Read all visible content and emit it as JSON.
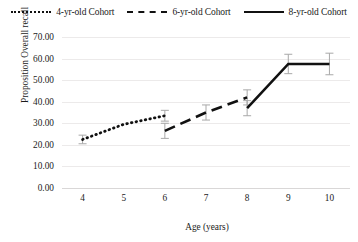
{
  "chart_data": {
    "type": "line",
    "title": "",
    "xlabel": "Age (years)",
    "ylabel": "Proposition Overall recall",
    "xlim": [
      3.5,
      10.5
    ],
    "ylim": [
      0,
      70
    ],
    "grid": true,
    "legend_position": "top",
    "x_tick_labels": [
      "4",
      "5",
      "6",
      "7",
      "8",
      "9",
      "10"
    ],
    "y_tick_labels": [
      "0.00",
      "10.00",
      "20.00",
      "30.00",
      "40.00",
      "50.00",
      "60.00",
      "70.00"
    ],
    "y_tick_values": [
      0,
      10,
      20,
      30,
      40,
      50,
      60,
      70
    ],
    "series": [
      {
        "name": "4-yr-old Cohort",
        "style": "dotted",
        "color": "#111111",
        "x": [
          4,
          5,
          6
        ],
        "values": [
          22.5,
          29.5,
          33.5
        ],
        "error": [
          2.0,
          0.0,
          2.5
        ]
      },
      {
        "name": "6-yr-old Cohort",
        "style": "dashed",
        "color": "#111111",
        "x": [
          6,
          7,
          8
        ],
        "values": [
          26.5,
          35.0,
          42.0
        ],
        "error": [
          3.5,
          3.5,
          3.5
        ]
      },
      {
        "name": "8-yr-old Cohort",
        "style": "solid",
        "color": "#111111",
        "x": [
          8,
          9,
          10
        ],
        "values": [
          37.0,
          57.5,
          57.5
        ],
        "error": [
          3.5,
          4.5,
          5.0
        ]
      }
    ]
  },
  "legend": {
    "items": [
      {
        "label": "4-yr-old Cohort",
        "swatch": "dotted-line-icon"
      },
      {
        "label": "6-yr-old Cohort",
        "swatch": "dashed-line-icon"
      },
      {
        "label": "8-yr-old Cohort",
        "swatch": "solid-line-icon"
      }
    ]
  }
}
